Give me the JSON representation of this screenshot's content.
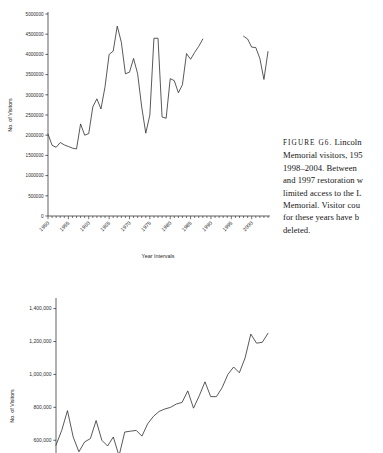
{
  "caption": {
    "figure_label": "FIGURE G6.",
    "lines": [
      "Lincoln",
      "Memorial visitors, 195",
      "1998–2004. Between",
      "and 1997 restoration w",
      "limited access to the L",
      "Memorial. Visitor cou",
      "for these years have b",
      "deleted."
    ]
  },
  "chart_data": [
    {
      "id": "lincoln-memorial-visitors-top",
      "type": "line",
      "title": "",
      "xlabel": "Year Intervals",
      "ylabel": "No. of Visitors",
      "xlim": [
        1950,
        2004
      ],
      "ylim": [
        0,
        5000000
      ],
      "ytick_labels": [
        "0",
        "500000",
        "1000000",
        "1500000",
        "2000000",
        "2500000",
        "3000000",
        "3500000",
        "4000000",
        "4500000",
        "5000000"
      ],
      "ytick_values": [
        0,
        500000,
        1000000,
        1500000,
        2000000,
        2500000,
        3000000,
        3500000,
        4000000,
        4500000,
        5000000
      ],
      "xtick_labels": [
        "1950",
        "1955",
        "1960",
        "1965",
        "1970",
        "1975",
        "1980",
        "1985",
        "1990",
        "1995",
        "2000"
      ],
      "xtick_values": [
        1950,
        1955,
        1960,
        1965,
        1970,
        1975,
        1980,
        1985,
        1990,
        1995,
        2000
      ],
      "minor_xticks_every": 1,
      "grid": false,
      "legend": "none",
      "gap_note": "1995–1997 counts deleted (line break)",
      "x": [
        1950,
        1951,
        1952,
        1953,
        1954,
        1955,
        1956,
        1957,
        1958,
        1959,
        1960,
        1961,
        1962,
        1963,
        1964,
        1965,
        1966,
        1967,
        1968,
        1969,
        1970,
        1971,
        1972,
        1973,
        1974,
        1975,
        1976,
        1977,
        1978,
        1979,
        1980,
        1981,
        1982,
        1983,
        1984,
        1985,
        1986,
        1987,
        1988,
        1998,
        1999,
        2000,
        2001,
        2002,
        2003,
        2004
      ],
      "y": [
        2030000,
        1750000,
        1700000,
        1820000,
        1760000,
        1720000,
        1680000,
        1660000,
        2280000,
        2000000,
        2040000,
        2700000,
        2900000,
        2650000,
        3200000,
        4000000,
        4080000,
        4700000,
        4300000,
        3520000,
        3560000,
        3900000,
        3520000,
        2700000,
        2050000,
        2500000,
        4400000,
        4400000,
        2450000,
        2420000,
        3400000,
        3350000,
        3050000,
        3250000,
        4020000,
        3880000,
        4050000,
        4200000,
        4380000,
        4450000,
        4380000,
        4180000,
        4170000,
        3900000,
        3380000,
        4070000
      ],
      "series_breaks": [
        [
          0,
          38
        ],
        [
          39,
          45
        ]
      ]
    },
    {
      "id": "visitors-bottom",
      "type": "line",
      "title": "",
      "xlabel": "",
      "ylabel": "No. of Visitors",
      "ylim": [
        480000,
        1440000
      ],
      "ytick_labels": [
        "600,000",
        "800,000",
        "1,000,000",
        "1,200,000",
        "1,400,000"
      ],
      "ytick_values": [
        600000,
        800000,
        1000000,
        1200000,
        1400000
      ],
      "grid": false,
      "legend": "none",
      "x": [
        0,
        1,
        2,
        3,
        4,
        5,
        6,
        7,
        8,
        9,
        10,
        11,
        12,
        13,
        14,
        15,
        16,
        17,
        18,
        19,
        20,
        21,
        22,
        23,
        24,
        25,
        26,
        27,
        28,
        29,
        30,
        31,
        32,
        33,
        34,
        35,
        36,
        37
      ],
      "y": [
        570000,
        660000,
        780000,
        620000,
        530000,
        590000,
        610000,
        720000,
        600000,
        565000,
        620000,
        505000,
        650000,
        655000,
        660000,
        625000,
        700000,
        745000,
        775000,
        790000,
        800000,
        820000,
        830000,
        900000,
        795000,
        870000,
        955000,
        865000,
        865000,
        920000,
        1000000,
        1045000,
        1010000,
        1100000,
        1245000,
        1190000,
        1195000,
        1250000
      ]
    }
  ]
}
